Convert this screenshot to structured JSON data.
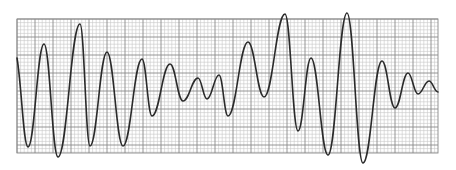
{
  "chart_data": {
    "type": "line",
    "title": "",
    "xlabel": "",
    "ylabel": "",
    "grid": true,
    "legend": null,
    "grid_area_px": {
      "x0": 17,
      "y0": 19,
      "x1": 438,
      "y1": 153
    },
    "grid_minor_spacing_px": 3.6,
    "grid_major_spacing_px": 18,
    "colors": {
      "background": "#ffffff",
      "minor_grid": "#c8c8c8",
      "major_grid": "#8a8a8a",
      "trace": "#2a2a2a"
    },
    "x": [
      17,
      28,
      44,
      58,
      80,
      90,
      107,
      123,
      142,
      152,
      170,
      183,
      198,
      207,
      219,
      228,
      248,
      264,
      285,
      298,
      311,
      328,
      347,
      363,
      382,
      395,
      408,
      418,
      429,
      438
    ],
    "y": [
      58,
      147,
      44,
      157,
      24,
      146,
      52,
      146,
      59,
      116,
      64,
      101,
      78,
      99,
      75,
      116,
      42,
      97,
      14,
      131,
      58,
      155,
      13,
      163,
      61,
      108,
      73,
      94,
      81,
      92
    ],
    "extrema_type": [
      "start",
      "min",
      "max",
      "min",
      "max",
      "min",
      "max",
      "min",
      "max",
      "min",
      "max",
      "min",
      "max",
      "min",
      "max",
      "min",
      "max",
      "min",
      "max",
      "min",
      "max",
      "min",
      "max",
      "min",
      "max",
      "min",
      "max",
      "min",
      "max",
      "end"
    ]
  }
}
